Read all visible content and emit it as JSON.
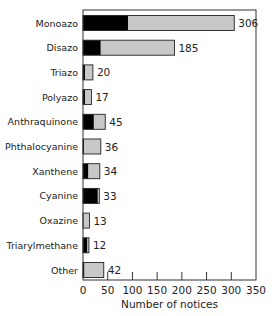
{
  "chart_data": {
    "type": "bar",
    "orientation": "horizontal",
    "stacked": true,
    "title": "",
    "xlabel": "Number of notices",
    "ylabel": "",
    "xlim": [
      0,
      350
    ],
    "xticks": [
      0,
      50,
      100,
      150,
      200,
      250,
      300,
      350
    ],
    "grid": false,
    "legend": null,
    "categories": [
      "Monoazo",
      "Disazo",
      "Triazo",
      "Polyazo",
      "Anthraquinone",
      "Phthalocyanine",
      "Xanthene",
      "Cyanine",
      "Oxazine",
      "Triarylmethane",
      "Other"
    ],
    "totals": [
      306,
      185,
      20,
      17,
      45,
      36,
      34,
      33,
      13,
      12,
      42
    ],
    "series": [
      {
        "name": "black segment",
        "color": "#000000",
        "values": [
          91,
          36,
          4,
          4,
          22,
          2,
          11,
          30,
          0,
          9,
          3
        ]
      },
      {
        "name": "gray segment",
        "color": "#c8c8c8",
        "values": [
          215,
          149,
          16,
          13,
          23,
          34,
          23,
          3,
          13,
          3,
          39
        ]
      }
    ]
  },
  "colors": {
    "dark": "#000000",
    "light": "#c8c8c8",
    "frame": "#333333"
  }
}
